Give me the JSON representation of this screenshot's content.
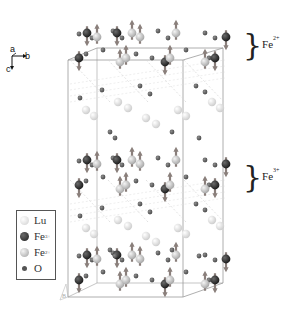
{
  "figure": {
    "axes": {
      "a": "a",
      "b": "b",
      "c": "c"
    },
    "legend": {
      "items": [
        {
          "label": "Lu",
          "charge": "",
          "color": "#dcdcdc",
          "size": "large"
        },
        {
          "label": "Fe",
          "charge": "3+",
          "color": "#2b2b2b",
          "size": "large"
        },
        {
          "label": "Fe",
          "charge": "2+",
          "color": "#9a9a9a",
          "size": "large"
        },
        {
          "label": "O",
          "charge": "",
          "color": "#5a5a5a",
          "size": "small"
        }
      ]
    },
    "annotations": [
      {
        "label": "Fe",
        "charge": "2+",
        "y": 45
      },
      {
        "label": "Fe",
        "charge": "3+",
        "y": 177
      }
    ],
    "corner_label": "B",
    "colors": {
      "lu": "#dcdcdc",
      "fe3": "#2e2e2e",
      "fe2": "#b9b9b9",
      "o": "#666666",
      "arrow": "#8a7f7b",
      "cell": "#9a9a9a"
    }
  }
}
